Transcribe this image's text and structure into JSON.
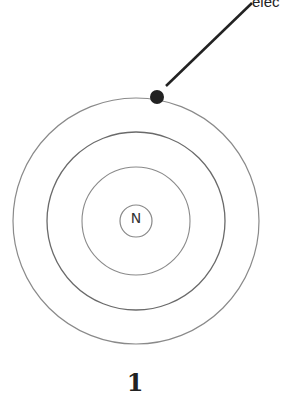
{
  "diagram": {
    "title_number": "1",
    "nucleus": {
      "label": "N",
      "cx": 136,
      "cy": 221,
      "r": 16
    },
    "shells": [
      {
        "r": 54
      },
      {
        "r": 89
      },
      {
        "r": 123
      }
    ],
    "electron": {
      "cx": 157,
      "cy": 97,
      "r": 7,
      "label": "elec"
    },
    "leader_line": {
      "x1": 166,
      "y1": 86,
      "x2": 252,
      "y2": 3
    },
    "colors": {
      "shell": "#777777",
      "electron": "#222222",
      "text": "#222222"
    }
  }
}
